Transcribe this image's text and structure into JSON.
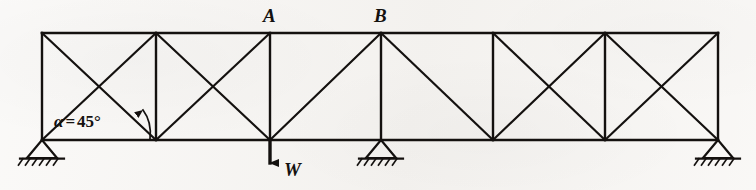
{
  "diagram": {
    "background_color": "#f6f4f1",
    "ink_color": "#14110f",
    "width": 756,
    "height": 190,
    "geometry": {
      "top_chord_y": 33,
      "bottom_chord_y": 140,
      "panel_count": 6,
      "panel_width": 113,
      "node_x": [
        42,
        156,
        270,
        381,
        493,
        605,
        718
      ],
      "top_nodes": [
        {
          "id": "T0",
          "x": 42,
          "y": 33
        },
        {
          "id": "T1",
          "x": 156,
          "y": 33
        },
        {
          "id": "T2",
          "x": 270,
          "y": 33
        },
        {
          "id": "T3",
          "x": 381,
          "y": 33
        },
        {
          "id": "T4",
          "x": 493,
          "y": 33
        },
        {
          "id": "T5",
          "x": 605,
          "y": 33
        },
        {
          "id": "T6",
          "x": 718,
          "y": 33
        }
      ],
      "bottom_nodes": [
        {
          "id": "B0",
          "x": 42,
          "y": 140
        },
        {
          "id": "B1",
          "x": 156,
          "y": 140
        },
        {
          "id": "B2",
          "x": 270,
          "y": 140
        },
        {
          "id": "B3",
          "x": 381,
          "y": 140
        },
        {
          "id": "B4",
          "x": 493,
          "y": 140
        },
        {
          "id": "B5",
          "x": 605,
          "y": 140
        },
        {
          "id": "B6",
          "x": 718,
          "y": 140
        }
      ],
      "verticals": [
        {
          "x": 42
        },
        {
          "x": 156
        },
        {
          "x": 270
        },
        {
          "x": 381
        },
        {
          "x": 493
        },
        {
          "x": 605
        },
        {
          "x": 718
        }
      ],
      "panels": [
        {
          "index": 1,
          "x_left": 42,
          "x_right": 156,
          "bracing": "X"
        },
        {
          "index": 2,
          "x_left": 156,
          "x_right": 270,
          "bracing": "X"
        },
        {
          "index": 3,
          "x_left": 270,
          "x_right": 381,
          "bracing": "rising"
        },
        {
          "index": 4,
          "x_left": 381,
          "x_right": 493,
          "bracing": "falling"
        },
        {
          "index": 5,
          "x_left": 493,
          "x_right": 605,
          "bracing": "X"
        },
        {
          "index": 6,
          "x_left": 605,
          "x_right": 718,
          "bracing": "X"
        }
      ]
    },
    "node_labels": [
      {
        "name": "A",
        "text": "A",
        "at_node": "T2",
        "x": 270,
        "y": 33
      },
      {
        "name": "B",
        "text": "B",
        "at_node": "T3",
        "x": 381,
        "y": 33
      }
    ],
    "angle_annotation": {
      "symbol": "α",
      "equals": "=",
      "value": "45°",
      "full_text": "α = 45°",
      "vertex_node": "B0",
      "measured_between": [
        "bottom-chord",
        "rising-diagonal"
      ]
    },
    "load": {
      "label": "W",
      "direction": "down",
      "applied_at_node": "B2",
      "x": 270,
      "y": 140
    },
    "supports": [
      {
        "type": "pinned",
        "at_node": "B0",
        "x": 42,
        "y": 140
      },
      {
        "type": "pinned",
        "at_node": "B3",
        "x": 381,
        "y": 140
      },
      {
        "type": "pinned",
        "at_node": "B6",
        "x": 718,
        "y": 140
      }
    ]
  }
}
